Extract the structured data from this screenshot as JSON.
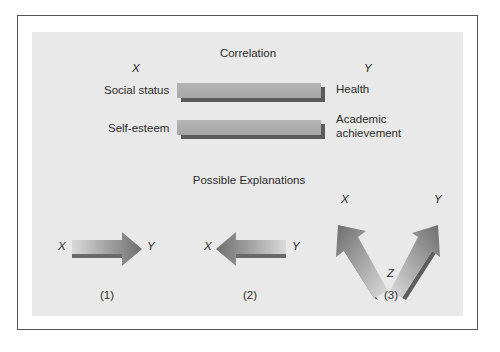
{
  "diagram": {
    "correlation": {
      "title": "Correlation",
      "x_header": "X",
      "y_header": "Y",
      "rows": [
        {
          "x_label": "Social status",
          "y_label": "Health"
        },
        {
          "x_label": "Self-esteem",
          "y_label_line1": "Academic",
          "y_label_line2": "achievement"
        }
      ]
    },
    "explanations": {
      "title": "Possible Explanations",
      "items": [
        {
          "number": "(1)",
          "from": "X",
          "to": "Y",
          "direction": "X causes Y"
        },
        {
          "number": "(2)",
          "from": "Y",
          "to": "X",
          "direction": "Y causes X"
        },
        {
          "number": "(3)",
          "source": "Z",
          "targets": [
            "X",
            "Y"
          ],
          "direction": "Z causes both X and Y"
        }
      ]
    },
    "colors": {
      "background": "#ffffff",
      "panel": "#e9e9e9",
      "bar_face": "#aaaaaa",
      "bar_shadow": "#5b5b5b",
      "arrow_dark": "#6e6e6e",
      "arrow_light": "#d9d9d9",
      "frame": "#555555"
    }
  }
}
